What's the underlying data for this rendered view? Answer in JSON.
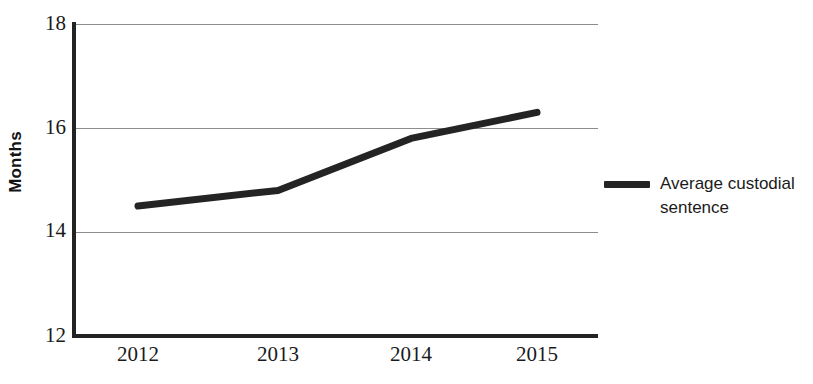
{
  "chart_data": {
    "type": "line",
    "title": "",
    "subtitle": "",
    "xlabel": "",
    "ylabel": "Months",
    "x": [
      "2012",
      "2013",
      "2014",
      "2015"
    ],
    "categories": [
      "2012",
      "2013",
      "2014",
      "2015"
    ],
    "series": [
      {
        "name": "Average custodial sentence",
        "values": [
          14.5,
          14.8,
          15.8,
          16.3
        ],
        "color": "#242424",
        "line_width": 7
      }
    ],
    "values": [
      14.5,
      14.8,
      15.8,
      16.3
    ],
    "ylim": [
      12,
      18
    ],
    "yticks": [
      12,
      14,
      16,
      18
    ],
    "ytick_labels": [
      "12",
      "14",
      "16",
      "18"
    ],
    "xtick_labels": [
      "2012",
      "2013",
      "2014",
      "2015"
    ],
    "grid": "horizontal",
    "grid_color": "#8d8d8d",
    "axis_color": "#232323",
    "legend_position": "right",
    "legend_entries": [
      "Average custodial sentence"
    ],
    "background": "#ffffff"
  },
  "axes": {
    "y_title": "Months",
    "y_ticks": [
      {
        "label": "18",
        "value": 18
      },
      {
        "label": "16",
        "value": 16
      },
      {
        "label": "14",
        "value": 14
      },
      {
        "label": "12",
        "value": 12
      }
    ],
    "x_ticks": [
      {
        "label": "2012",
        "value": 2012
      },
      {
        "label": "2013",
        "value": 2013
      },
      {
        "label": "2014",
        "value": 2014
      },
      {
        "label": "2015",
        "value": 2015
      }
    ]
  },
  "legend": {
    "items": [
      {
        "label": "Average custodial sentence",
        "color": "#242424"
      }
    ]
  }
}
